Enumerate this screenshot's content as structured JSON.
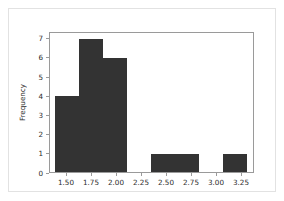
{
  "figure": {
    "background_color": "#ffffff",
    "border_color": "#e2e2e2",
    "frame_color": "#9a9a9a"
  },
  "chart_data": {
    "type": "bar",
    "subtype": "histogram",
    "title": "",
    "xlabel": "",
    "ylabel": "Frequency",
    "bar_color": "#333333",
    "grid": false,
    "legend": false,
    "xlim": [
      1.33,
      3.38
    ],
    "ylim": [
      0,
      7.35
    ],
    "xticks": [
      1.5,
      1.75,
      2.0,
      2.25,
      2.5,
      2.75,
      3.0,
      3.25
    ],
    "xtick_labels": [
      "1.50",
      "1.75",
      "2.00",
      "2.25",
      "2.50",
      "2.75",
      "3.00",
      "3.25"
    ],
    "yticks": [
      0,
      1,
      2,
      3,
      4,
      5,
      6,
      7
    ],
    "ytick_labels": [
      "0",
      "1",
      "2",
      "3",
      "4",
      "5",
      "6",
      "7"
    ],
    "bins": [
      {
        "left": 1.39,
        "right": 1.63,
        "frequency": 4
      },
      {
        "left": 1.63,
        "right": 1.87,
        "frequency": 7
      },
      {
        "left": 1.87,
        "right": 2.11,
        "frequency": 6
      },
      {
        "left": 2.11,
        "right": 2.35,
        "frequency": 0
      },
      {
        "left": 2.35,
        "right": 2.59,
        "frequency": 1
      },
      {
        "left": 2.59,
        "right": 2.83,
        "frequency": 1
      },
      {
        "left": 2.83,
        "right": 3.07,
        "frequency": 0
      },
      {
        "left": 3.07,
        "right": 3.31,
        "frequency": 1
      }
    ],
    "categories": [
      "1.39-1.63",
      "1.63-1.87",
      "1.87-2.11",
      "2.11-2.35",
      "2.35-2.59",
      "2.59-2.83",
      "2.83-3.07",
      "3.07-3.31"
    ],
    "values": [
      4,
      7,
      6,
      0,
      1,
      1,
      0,
      1
    ]
  }
}
